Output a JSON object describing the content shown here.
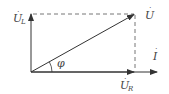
{
  "diagram": {
    "type": "phasor-diagram",
    "colors": {
      "line": "#333333",
      "dashed": "#666666",
      "text": "#444444",
      "background": "#ffffff"
    },
    "phasors": {
      "U": {
        "symbol": "U",
        "subscript": "",
        "dot": "·",
        "description": "total voltage phasor"
      },
      "UL": {
        "symbol": "U",
        "subscript": "L",
        "dot": "·",
        "description": "inductor voltage phasor"
      },
      "UR": {
        "symbol": "U",
        "subscript": "R",
        "dot": "·",
        "description": "resistor voltage phasor"
      },
      "I": {
        "symbol": "I",
        "subscript": "",
        "dot": "·",
        "description": "current phasor (reference)"
      }
    },
    "angle": {
      "symbol": "φ",
      "description": "phase angle between U and I"
    }
  }
}
